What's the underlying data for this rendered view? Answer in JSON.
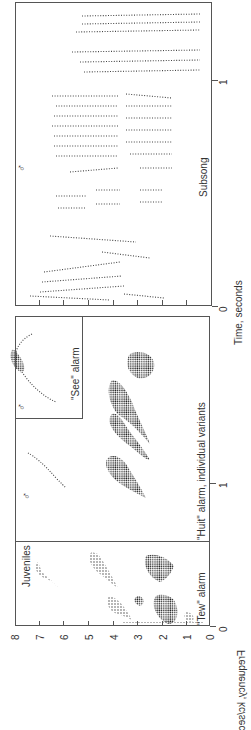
{
  "figure": {
    "orientation": "rotated 90 degrees counter-clockwise",
    "frequency_axis": {
      "label": "Frequency, kc/sec",
      "ticks": [
        "0",
        "1",
        "2",
        "3",
        "4",
        "5",
        "6",
        "7",
        "8"
      ]
    },
    "time_axis": {
      "label": "Time, seconds",
      "left_panel_ticks": [
        "0",
        "1"
      ],
      "right_panel_ticks": [
        "0",
        "1"
      ]
    },
    "panels": {
      "juveniles": {
        "title": "Juveniles",
        "caption": "\"Tew\" alarm"
      },
      "huit": {
        "caption": "\"Huit\" alarm, individual variants",
        "symbol": "♂"
      },
      "see": {
        "caption": "\"See\" alarm",
        "symbol": "♂"
      },
      "subsong": {
        "caption": "Subsong",
        "symbol": "♂"
      }
    }
  }
}
